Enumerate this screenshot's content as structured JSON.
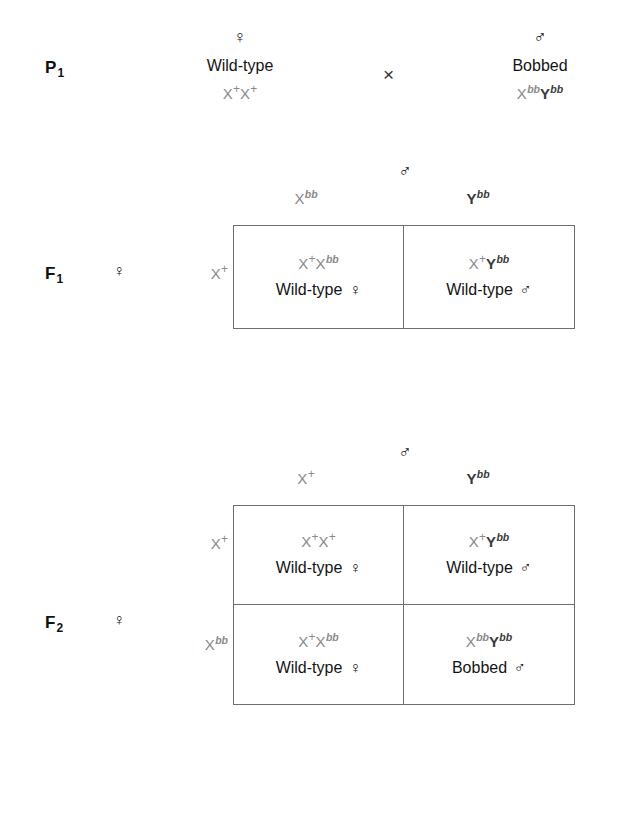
{
  "figure": {
    "type": "genetics-punnett-cross",
    "title_visible": false
  },
  "symbols": {
    "female": "♀",
    "male": "♂",
    "cross": "×"
  },
  "colors": {
    "genotype_gray": "#8a8a8a",
    "phenotype_black": "#141414",
    "box_border": "#6e6e6e",
    "shadow": "#c9c9c9",
    "background": "#ffffff"
  },
  "p1": {
    "generation_label": "P",
    "generation_sub": "1",
    "female_parent": {
      "sex_symbol": "♀",
      "phenotype": "Wild-type",
      "genotype_parts": [
        {
          "base": "X",
          "sup": "+",
          "sup_style": "plus"
        },
        {
          "base": "X",
          "sup": "+",
          "sup_style": "plus"
        }
      ]
    },
    "cross_symbol": "×",
    "male_parent": {
      "sex_symbol": "♂",
      "phenotype": "Bobbed",
      "genotype_parts": [
        {
          "base": "X",
          "sup": "bb",
          "sup_style": "italic"
        },
        {
          "base": "Y",
          "sup": "bb",
          "sup_style": "italic",
          "dark": true
        }
      ]
    }
  },
  "f1": {
    "generation_label": "F",
    "generation_sub": "1",
    "row_sex_symbol": "♀",
    "col_sex_symbol": "♂",
    "column_headers": [
      {
        "base": "X",
        "sup": "bb",
        "sup_style": "italic"
      },
      {
        "base": "Y",
        "sup": "bb",
        "sup_style": "italic",
        "dark": true
      }
    ],
    "row_headers": [
      {
        "base": "X",
        "sup": "+",
        "sup_style": "plus"
      }
    ],
    "cells": [
      [
        {
          "genotype_parts": [
            {
              "base": "X",
              "sup": "+",
              "sup_style": "plus"
            },
            {
              "base": "X",
              "sup": "bb",
              "sup_style": "italic"
            }
          ],
          "phenotype": "Wild-type",
          "sex_symbol": "♀"
        },
        {
          "genotype_parts": [
            {
              "base": "X",
              "sup": "+",
              "sup_style": "plus"
            },
            {
              "base": "Y",
              "sup": "bb",
              "sup_style": "italic",
              "dark": true
            }
          ],
          "phenotype": "Wild-type",
          "sex_symbol": "♂"
        }
      ]
    ]
  },
  "f2": {
    "generation_label": "F",
    "generation_sub": "2",
    "row_sex_symbol": "♀",
    "col_sex_symbol": "♂",
    "column_headers": [
      {
        "base": "X",
        "sup": "+",
        "sup_style": "plus"
      },
      {
        "base": "Y",
        "sup": "bb",
        "sup_style": "italic",
        "dark": true
      }
    ],
    "row_headers": [
      {
        "base": "X",
        "sup": "+",
        "sup_style": "plus"
      },
      {
        "base": "X",
        "sup": "bb",
        "sup_style": "italic"
      }
    ],
    "cells": [
      [
        {
          "genotype_parts": [
            {
              "base": "X",
              "sup": "+",
              "sup_style": "plus"
            },
            {
              "base": "X",
              "sup": "+",
              "sup_style": "plus"
            }
          ],
          "phenotype": "Wild-type",
          "sex_symbol": "♀"
        },
        {
          "genotype_parts": [
            {
              "base": "X",
              "sup": "+",
              "sup_style": "plus"
            },
            {
              "base": "Y",
              "sup": "bb",
              "sup_style": "italic",
              "dark": true
            }
          ],
          "phenotype": "Wild-type",
          "sex_symbol": "♂"
        }
      ],
      [
        {
          "genotype_parts": [
            {
              "base": "X",
              "sup": "+",
              "sup_style": "plus"
            },
            {
              "base": "X",
              "sup": "bb",
              "sup_style": "italic"
            }
          ],
          "phenotype": "Wild-type",
          "sex_symbol": "♀"
        },
        {
          "genotype_parts": [
            {
              "base": "X",
              "sup": "bb",
              "sup_style": "italic"
            },
            {
              "base": "Y",
              "sup": "bb",
              "sup_style": "italic",
              "dark": true
            }
          ],
          "phenotype": "Bobbed",
          "sex_symbol": "♂"
        }
      ]
    ]
  }
}
